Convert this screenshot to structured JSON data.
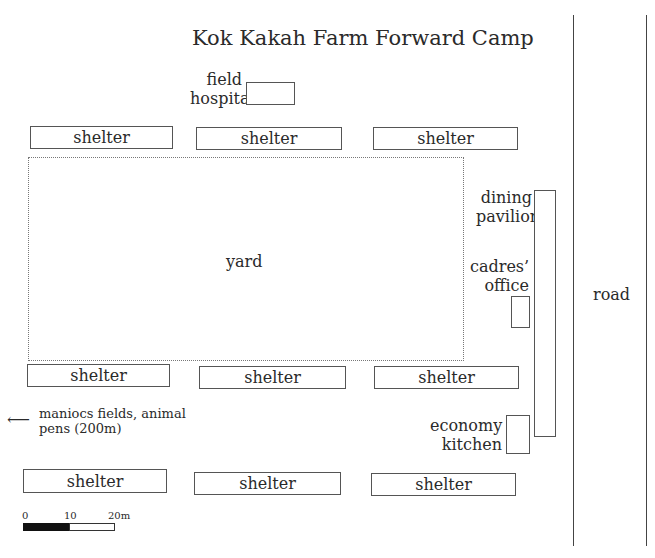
{
  "title": "Kok Kakah Farm Forward Camp",
  "field_hospital": {
    "label_line1": "field",
    "label_line2": "hospital"
  },
  "yard": {
    "label": "yard"
  },
  "shelters": {
    "top_row": [
      "shelter",
      "shelter",
      "shelter"
    ],
    "middle_row": [
      "shelter",
      "shelter",
      "shelter"
    ],
    "bottom_row": [
      "shelter",
      "shelter",
      "shelter"
    ]
  },
  "dining_pavilion": {
    "label_line1": "dining",
    "label_line2": "pavilion"
  },
  "cadres_office": {
    "label_line1": "cadres’",
    "label_line2": "office"
  },
  "economy_kitchen": {
    "label_line1": "economy",
    "label_line2": "kitchen"
  },
  "road": {
    "label": "road"
  },
  "direction_note": {
    "arrow": "⟵",
    "line1": "maniocs fields, animal",
    "line2": "pens (200m)"
  },
  "scale_bar": {
    "ticks": [
      "0",
      "10",
      "20m"
    ]
  }
}
